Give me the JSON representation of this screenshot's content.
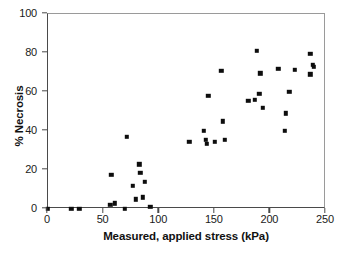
{
  "chart_data": {
    "type": "scatter",
    "title": "",
    "xlabel": "Measured, applied stress (kPa)",
    "ylabel": "% Necrosis",
    "xlim": [
      0,
      250
    ],
    "ylim": [
      0,
      100
    ],
    "xticks": [
      0,
      50,
      100,
      150,
      200,
      250
    ],
    "yticks": [
      0,
      20,
      40,
      60,
      80,
      100
    ],
    "grid": false,
    "legend": null,
    "marker": "square",
    "marker_color": "#0d0d0d",
    "series": [
      {
        "name": "Necrosis vs applied stress",
        "points": [
          [
            0,
            0
          ],
          [
            21,
            0
          ],
          [
            28,
            0
          ],
          [
            56,
            2
          ],
          [
            60,
            3
          ],
          [
            57,
            17.5
          ],
          [
            69,
            0
          ],
          [
            71,
            37
          ],
          [
            76,
            12
          ],
          [
            79,
            5
          ],
          [
            82,
            23
          ],
          [
            83,
            18.5
          ],
          [
            85,
            6
          ],
          [
            87,
            14
          ],
          [
            92,
            1
          ],
          [
            127,
            34.5
          ],
          [
            140,
            40
          ],
          [
            142,
            35.5
          ],
          [
            143,
            33.5
          ],
          [
            144,
            58
          ],
          [
            150,
            34.5
          ],
          [
            156,
            71
          ],
          [
            157,
            45
          ],
          [
            159,
            35.5
          ],
          [
            180,
            55.5
          ],
          [
            186,
            56
          ],
          [
            188,
            81
          ],
          [
            190,
            59
          ],
          [
            191,
            69.5
          ],
          [
            193,
            52
          ],
          [
            207,
            72
          ],
          [
            213,
            40
          ],
          [
            214,
            49
          ],
          [
            217,
            60
          ],
          [
            222,
            71.5
          ],
          [
            236,
            79.5
          ],
          [
            236,
            69
          ],
          [
            238,
            74
          ],
          [
            239,
            73
          ]
        ]
      }
    ]
  },
  "axes": {
    "x_tick_labels": [
      "0",
      "50",
      "100",
      "150",
      "200",
      "250"
    ],
    "y_tick_labels": [
      "0",
      "20",
      "40",
      "60",
      "80",
      "100"
    ],
    "x_title": "Measured, applied stress (kPa)",
    "y_title": "% Necrosis"
  }
}
